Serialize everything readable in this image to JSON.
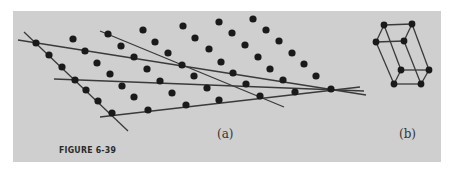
{
  "figure": {
    "caption": "FIGURE 6-39",
    "panel_a_label": "(a)",
    "panel_b_label": "(b)",
    "colors": {
      "page_background": "#ffffff",
      "panel_background": "#cfcfcf",
      "ink": "#1a1a1a",
      "line": "#3a3a3a"
    }
  },
  "lattice": {
    "description": "2D oblique point lattice with straight lines drawn through lattice rows",
    "points": [
      [
        36,
        43
      ],
      [
        49,
        55
      ],
      [
        62,
        67
      ],
      [
        75,
        80
      ],
      [
        86,
        90
      ],
      [
        98,
        101
      ],
      [
        112,
        113
      ],
      [
        73,
        39
      ],
      [
        85,
        51
      ],
      [
        97,
        63
      ],
      [
        110,
        74
      ],
      [
        122,
        86
      ],
      [
        134,
        97
      ],
      [
        148,
        110
      ],
      [
        108,
        34
      ],
      [
        121,
        46
      ],
      [
        134,
        57
      ],
      [
        147,
        69
      ],
      [
        160,
        81
      ],
      [
        172,
        93
      ],
      [
        186,
        105
      ],
      [
        143,
        30
      ],
      [
        155,
        42
      ],
      [
        168,
        53
      ],
      [
        182,
        65
      ],
      [
        194,
        76
      ],
      [
        207,
        88
      ],
      [
        219,
        100
      ],
      [
        183,
        26
      ],
      [
        195,
        38
      ],
      [
        209,
        49
      ],
      [
        221,
        62
      ],
      [
        233,
        73
      ],
      [
        246,
        84
      ],
      [
        260,
        96
      ],
      [
        219,
        22
      ],
      [
        232,
        33
      ],
      [
        245,
        45
      ],
      [
        258,
        57
      ],
      [
        270,
        69
      ],
      [
        283,
        80
      ],
      [
        295,
        92
      ],
      [
        253,
        19
      ],
      [
        266,
        30
      ],
      [
        279,
        41
      ],
      [
        292,
        53
      ],
      [
        304,
        64
      ],
      [
        316,
        76
      ],
      [
        331,
        89
      ]
    ],
    "lines": [
      {
        "x1": 24,
        "y1": 32,
        "x2": 128,
        "y2": 131
      },
      {
        "x1": 18,
        "y1": 40,
        "x2": 366,
        "y2": 95
      },
      {
        "x1": 100,
        "y1": 31,
        "x2": 284,
        "y2": 107
      },
      {
        "x1": 54,
        "y1": 79,
        "x2": 364,
        "y2": 91
      },
      {
        "x1": 100,
        "y1": 117,
        "x2": 360,
        "y2": 87
      }
    ]
  },
  "unit_cell": {
    "description": "3D parallelepiped unit cell drawn in panel (b)",
    "vertices": {
      "top_back_left": [
        384,
        25
      ],
      "top_back_right": [
        412,
        24
      ],
      "top_front_left": [
        376,
        42
      ],
      "top_front_right": [
        404,
        41
      ],
      "bottom_back_left": [
        401,
        70
      ],
      "bottom_back_right": [
        429,
        70
      ],
      "bottom_front_left": [
        394,
        84
      ],
      "bottom_front_right": [
        421,
        84
      ]
    }
  }
}
